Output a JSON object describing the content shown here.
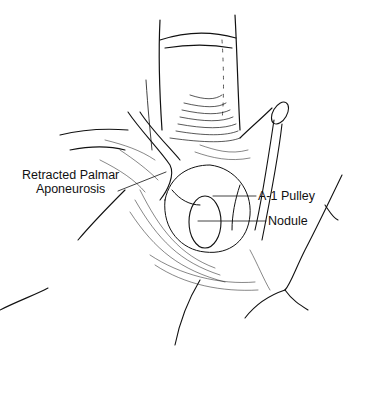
{
  "figure": {
    "labels": [
      {
        "id": "retracted-palmar-aponeurosis",
        "lines": [
          "Retracted Palmar",
          "Aponeurosis"
        ]
      },
      {
        "id": "a1-pulley",
        "lines": [
          "A-1 Pulley"
        ]
      },
      {
        "id": "nodule",
        "lines": [
          "Nodule"
        ]
      }
    ],
    "colors": {
      "ink": "#111111",
      "background": "#ffffff"
    }
  }
}
